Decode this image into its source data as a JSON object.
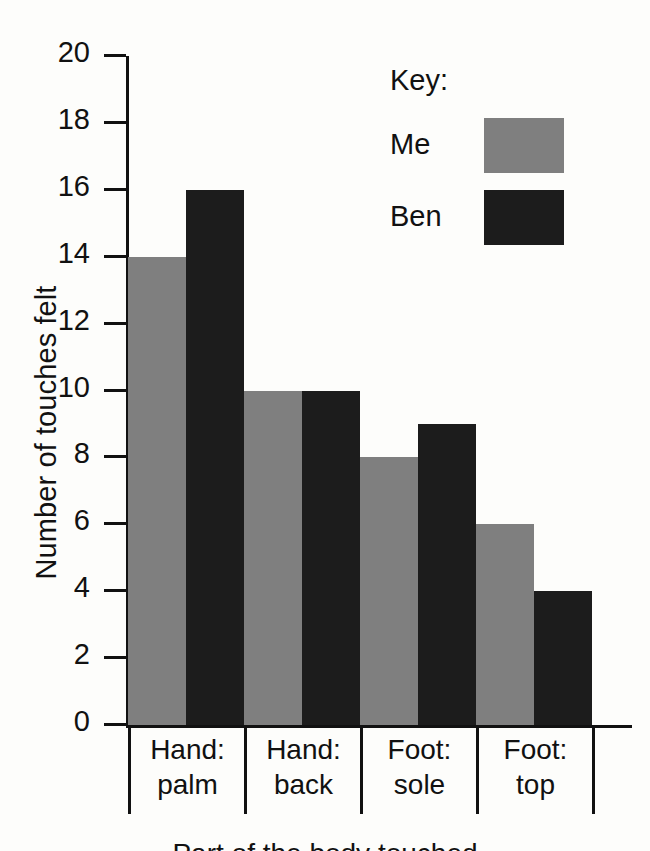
{
  "chart_data": {
    "type": "bar",
    "title": "",
    "xlabel": "Part of the body touched",
    "ylabel": "Number of touches felt",
    "ylim": [
      0,
      20
    ],
    "ytick_step": 2,
    "yticks": [
      20,
      18,
      16,
      14,
      12,
      10,
      8,
      6,
      4,
      2,
      0
    ],
    "grid": false,
    "legend_position": "top-right",
    "categories": [
      "Hand: palm",
      "Hand: back",
      "Foot: sole",
      "Foot: top"
    ],
    "category_lines": [
      [
        "Hand:",
        "palm"
      ],
      [
        "Hand:",
        "back"
      ],
      [
        "Foot:",
        "sole"
      ],
      [
        "Foot:",
        "top"
      ]
    ],
    "series": [
      {
        "name": "Me",
        "color": "#7f7f7f",
        "values": [
          14,
          10,
          8,
          6
        ]
      },
      {
        "name": "Ben",
        "color": "#1c1c1c",
        "values": [
          16,
          10,
          9,
          4
        ]
      }
    ]
  },
  "legend": {
    "title": "Key:",
    "entries": [
      {
        "label": "Me",
        "color": "#7f7f7f"
      },
      {
        "label": "Ben",
        "color": "#1c1c1c"
      }
    ]
  },
  "axes": {
    "y_title": "Number of touches felt",
    "x_title": "Part of the body touched",
    "y_tick_labels": [
      "20",
      "18",
      "16",
      "14",
      "12",
      "10",
      "8",
      "6",
      "4",
      "2",
      "0"
    ]
  },
  "colors": {
    "background": "#fdfdfb",
    "axis": "#111111",
    "series_me": "#7f7f7f",
    "series_ben": "#1c1c1c"
  }
}
